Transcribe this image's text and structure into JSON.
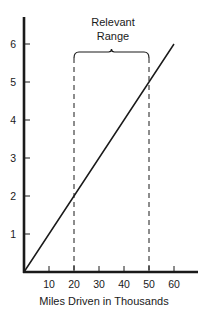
{
  "chart_data": {
    "type": "line",
    "title": "",
    "xlabel": "Miles Driven in Thousands",
    "ylabel": "",
    "xlim": [
      0,
      68
    ],
    "ylim": [
      0,
      6.7
    ],
    "x_ticks": [
      10,
      20,
      30,
      40,
      50,
      60
    ],
    "y_ticks": [
      1,
      2,
      3,
      4,
      5,
      6
    ],
    "grid": false,
    "legend": null,
    "series": [
      {
        "name": "Cost",
        "x": [
          0,
          10,
          20,
          30,
          40,
          50,
          60
        ],
        "values": [
          0,
          1,
          2,
          3,
          4,
          5,
          6
        ]
      }
    ],
    "annotations": [
      {
        "type": "bracket-range",
        "label_line1": "Relevant",
        "label_line2": "Range",
        "x_start": 20,
        "x_end": 50,
        "style": "dashed vertical lines"
      }
    ]
  },
  "labels": {
    "x_axis_title": "Miles Driven in Thousands",
    "range_line1": "Relevant",
    "range_line2": "Range",
    "x_ticks": [
      "10",
      "20",
      "30",
      "40",
      "50",
      "60"
    ],
    "y_ticks": [
      "1",
      "2",
      "3",
      "4",
      "5",
      "6"
    ]
  },
  "colors": {
    "ink": "#1a1a1a",
    "background": "#ffffff"
  }
}
